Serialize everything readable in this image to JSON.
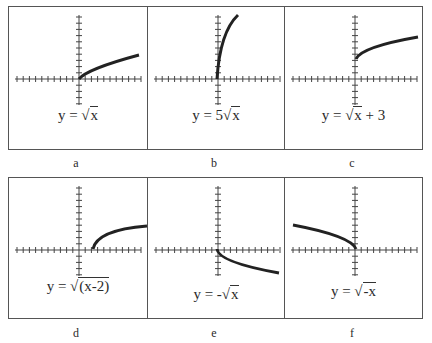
{
  "panels": [
    {
      "id": "a",
      "equation": "y = √x",
      "eq_prefix": "y = ",
      "eq_coef": "",
      "eq_radicand": "x",
      "eq_suffix": "",
      "label": "a"
    },
    {
      "id": "b",
      "equation": "y = 5√x",
      "eq_prefix": "y =  ",
      "eq_coef": "5",
      "eq_radicand": "x",
      "eq_suffix": "",
      "label": "b"
    },
    {
      "id": "c",
      "equation": "y = √x + 3",
      "eq_prefix": "y = ",
      "eq_coef": "",
      "eq_radicand": "x",
      "eq_suffix": " + 3",
      "label": "c"
    },
    {
      "id": "d",
      "equation": "y = √(x-2)",
      "eq_prefix": "y = ",
      "eq_coef": "",
      "eq_radicand": "(x-2)",
      "eq_suffix": "",
      "label": "d"
    },
    {
      "id": "e",
      "equation": "y = -√x",
      "eq_prefix": "y = ",
      "eq_coef": "-",
      "eq_radicand": "x",
      "eq_suffix": "",
      "label": "e"
    },
    {
      "id": "f",
      "equation": "y = √-x",
      "eq_prefix": "y = ",
      "eq_coef": "",
      "eq_radicand": "-x",
      "eq_suffix": "",
      "label": "f"
    }
  ],
  "chart_data": [
    {
      "type": "line",
      "title": "y = √x",
      "label": "a",
      "xlim": [
        -10,
        10
      ],
      "ylim": [
        -4,
        10
      ],
      "x": [
        0,
        1,
        4,
        9
      ],
      "y": [
        0,
        1,
        2,
        3
      ]
    },
    {
      "type": "line",
      "title": "y = 5√x",
      "label": "b",
      "xlim": [
        -10,
        10
      ],
      "ylim": [
        -4,
        10
      ],
      "x": [
        0,
        1,
        2,
        4
      ],
      "y": [
        0,
        5,
        7.07,
        10
      ]
    },
    {
      "type": "line",
      "title": "y = √x + 3",
      "label": "c",
      "xlim": [
        -10,
        10
      ],
      "ylim": [
        -4,
        10
      ],
      "x": [
        0,
        1,
        4,
        9
      ],
      "y": [
        3,
        4,
        5,
        6
      ]
    },
    {
      "type": "line",
      "title": "y = √(x-2)",
      "label": "d",
      "xlim": [
        -10,
        10
      ],
      "ylim": [
        -4,
        10
      ],
      "x": [
        2,
        3,
        6,
        11
      ],
      "y": [
        0,
        1,
        2,
        3
      ]
    },
    {
      "type": "line",
      "title": "y = -√x",
      "label": "e",
      "xlim": [
        -10,
        10
      ],
      "ylim": [
        -4,
        10
      ],
      "x": [
        0,
        1,
        4,
        9
      ],
      "y": [
        0,
        -1,
        -2,
        -3
      ]
    },
    {
      "type": "line",
      "title": "y = √-x",
      "label": "f",
      "xlim": [
        -10,
        10
      ],
      "ylim": [
        -4,
        10
      ],
      "x": [
        -9,
        -4,
        -1,
        0
      ],
      "y": [
        3,
        2,
        1,
        0
      ]
    }
  ]
}
